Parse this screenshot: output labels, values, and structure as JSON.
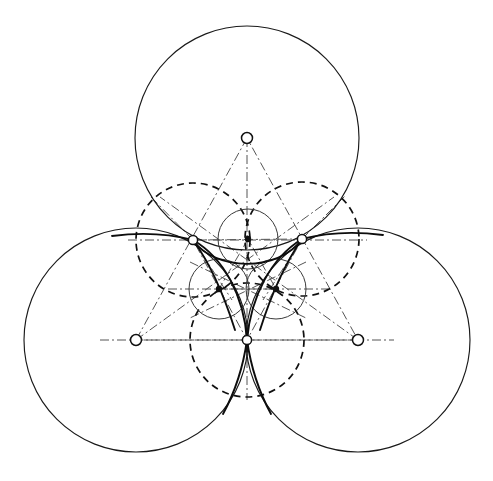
{
  "figure": {
    "canvas": {
      "width": 493,
      "height": 481,
      "background": "#ffffff"
    },
    "colors": {
      "solid": "#1a1a1a",
      "curve": "#0d0d0d",
      "dashed": "#111111",
      "small_circle": "#3a3a3a",
      "dashdot": "#555555",
      "node_fill": "#ffffff",
      "node_stroke": "#111111"
    },
    "large_circles": [
      {
        "name": "top-large-circle",
        "cx": 247,
        "cy": 138,
        "r": 112
      },
      {
        "name": "left-large-circle",
        "cx": 136,
        "cy": 340,
        "r": 112
      },
      {
        "name": "right-large-circle",
        "cx": 358,
        "cy": 340,
        "r": 112
      }
    ],
    "dashed_circles": [
      {
        "name": "dashed-circle-upper-left",
        "cx": 193,
        "cy": 240,
        "r": 57
      },
      {
        "name": "dashed-circle-upper-right",
        "cx": 302,
        "cy": 239,
        "r": 57
      },
      {
        "name": "dashed-circle-lower",
        "cx": 247,
        "cy": 340,
        "r": 57
      }
    ],
    "small_circles": [
      {
        "name": "small-circle-top",
        "cx": 248,
        "cy": 239,
        "r": 30
      },
      {
        "name": "small-circle-lower-left",
        "cx": 219,
        "cy": 289,
        "r": 30
      },
      {
        "name": "small-circle-lower-right",
        "cx": 276,
        "cy": 289,
        "r": 30
      }
    ],
    "large_centers": [
      {
        "name": "center-node-top",
        "cx": 247,
        "cy": 138,
        "r": 5.5,
        "style": "open"
      },
      {
        "name": "center-node-left",
        "cx": 136,
        "cy": 340,
        "r": 5.5,
        "style": "open"
      },
      {
        "name": "center-node-right",
        "cx": 358,
        "cy": 340,
        "r": 5.5,
        "style": "open"
      }
    ],
    "tangent_nodes": [
      {
        "name": "tangent-node-upper-left",
        "cx": 193,
        "cy": 240,
        "r": 4.6,
        "style": "open"
      },
      {
        "name": "tangent-node-upper-right",
        "cx": 302,
        "cy": 239,
        "r": 4.6,
        "style": "open"
      },
      {
        "name": "tangent-node-bottom",
        "cx": 247,
        "cy": 340,
        "r": 4.6,
        "style": "open"
      }
    ],
    "small_center_nodes": [
      {
        "name": "small-center-node-top",
        "cx": 248,
        "cy": 239,
        "r": 3.2,
        "style": "dot"
      },
      {
        "name": "small-center-node-lower-left",
        "cx": 219,
        "cy": 289,
        "r": 3.2,
        "style": "dot"
      },
      {
        "name": "small-center-node-lower-right",
        "cx": 276,
        "cy": 289,
        "r": 3.2,
        "style": "dot"
      }
    ],
    "outer_triangle": {
      "name": "outer-centers-triangle",
      "points": "247,138 136,340 358,340"
    },
    "inner_triangle": {
      "name": "inner-tangent-triangle",
      "points": "193,240 302,239 247,340"
    },
    "small_triangle": {
      "name": "small-centers-triangle",
      "points": "248,239 219,289 276,289"
    },
    "axis_lines": [
      {
        "name": "axis-horizontal-upper",
        "x1": 128,
        "y1": 240,
        "x2": 367,
        "y2": 240
      },
      {
        "name": "axis-horizontal-lower",
        "x1": 100,
        "y1": 340,
        "x2": 394,
        "y2": 340
      },
      {
        "name": "axis-median-top",
        "x1": 247,
        "y1": 138,
        "x2": 247,
        "y2": 397
      },
      {
        "name": "axis-median-left",
        "x1": 136,
        "y1": 340,
        "x2": 330,
        "y2": 200
      },
      {
        "name": "axis-median-right",
        "x1": 358,
        "y1": 340,
        "x2": 164,
        "y2": 200
      },
      {
        "name": "axis-small-left",
        "x1": 165,
        "y1": 289,
        "x2": 330,
        "y2": 289
      },
      {
        "name": "axis-small-right",
        "x1": 185,
        "y1": 262,
        "x2": 310,
        "y2": 316
      },
      {
        "name": "axis-small-cross",
        "x1": 310,
        "y1": 262,
        "x2": 185,
        "y2": 316
      }
    ],
    "deltoid": {
      "name": "deltoid-curve",
      "description": "Three-cusped hypocycloid-like arcs meeting at the tangent nodes",
      "cusps": [
        {
          "x": 193,
          "y": 240
        },
        {
          "x": 302,
          "y": 239
        },
        {
          "x": 247,
          "y": 340
        }
      ]
    },
    "arc_paths": {
      "top_arc": "M 193 240 Q 247 295 302 239",
      "left_arc": "M 193 240 Q 247 270 247 340",
      "right_arc": "M 302 239 Q 247 270 247 340",
      "tail_left": "M 247 340 Q 241 380 228 412",
      "tail_right": "M 247 340 Q 253 380 266 412"
    }
  }
}
